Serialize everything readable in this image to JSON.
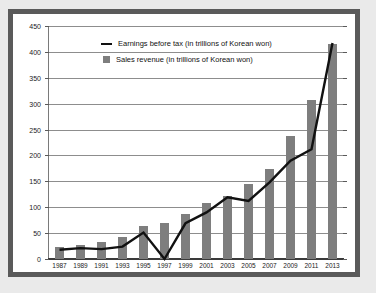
{
  "chart_data": {
    "type": "bar",
    "title": "",
    "subtitle": "",
    "xlabel": "",
    "ylabel": "",
    "ylim": [
      0,
      450
    ],
    "ytick_step": 50,
    "yticks": [
      0,
      50,
      100,
      150,
      200,
      250,
      300,
      350,
      400,
      450
    ],
    "grid": true,
    "legend_position": "top-left-inside",
    "categories": [
      "1987",
      "1989",
      "1991",
      "1993",
      "1995",
      "1997",
      "1999",
      "2001",
      "2003",
      "2005",
      "2007",
      "2009",
      "2011",
      "2013"
    ],
    "series": [
      {
        "name": "Sales revenue (in trillions of Korean won)",
        "type": "bar",
        "color": "#7e7e7e",
        "values": [
          23,
          27,
          32,
          43,
          64,
          70,
          87,
          109,
          121,
          145,
          173,
          238,
          308,
          415
        ]
      },
      {
        "name": "Earnings before tax (in trillions of Korean won)",
        "type": "line",
        "color": "#111111",
        "values": [
          18,
          21,
          19,
          24,
          51,
          0,
          69,
          90,
          119,
          112,
          148,
          190,
          212,
          417
        ]
      }
    ]
  },
  "legend": {
    "items": [
      {
        "marker": "line-marker",
        "label": "Earnings before tax (in trillions of Korean won)"
      },
      {
        "marker": "square-marker",
        "label": "Sales revenue (in trillions of Korean won)"
      }
    ]
  },
  "colors": {
    "bar": "#7e7e7e",
    "line": "#111111",
    "grid": "#8d8d8d",
    "frame": "#5a5a5a",
    "page_background": "#eaeaea",
    "plot_background": "#ffffff"
  }
}
